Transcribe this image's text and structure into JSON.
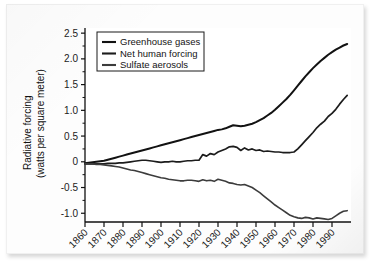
{
  "figure": {
    "kind": "scanned-line-chart",
    "background_color": "#fdfdfd"
  },
  "chart_data": {
    "type": "line",
    "title": "",
    "xlabel": "",
    "ylabel": "Radiative forcing (watts per square meter)",
    "ylabel_line1": "Radiative forcing",
    "ylabel_line2": "(watts per square meter)",
    "xlim": [
      1860,
      2000
    ],
    "ylim": [
      -1.17,
      2.6
    ],
    "grid": false,
    "legend_position": "upper-left",
    "y_ticks": [
      2.5,
      2.0,
      1.5,
      1.0,
      0.5,
      0,
      -0.5,
      -1.0
    ],
    "y_tick_labels": [
      "2.5",
      "2.0",
      "1.5",
      "1.0",
      "0.5",
      "0",
      "-0.5",
      "-1.0"
    ],
    "y_minor_tick_step": 0.25,
    "x_ticks": [
      1860,
      1870,
      1880,
      1890,
      1900,
      1910,
      1920,
      1930,
      1940,
      1950,
      1960,
      1970,
      1980,
      1990
    ],
    "x_tick_labels": [
      "1860",
      "1870",
      "1880",
      "1890",
      "1900",
      "1910",
      "1920",
      "1930",
      "1940",
      "1950",
      "1960",
      "1970",
      "1980",
      "1990"
    ],
    "x_tick_label_rotation": -45,
    "x": [
      1860,
      1862,
      1864,
      1866,
      1868,
      1870,
      1872,
      1874,
      1876,
      1878,
      1880,
      1882,
      1884,
      1886,
      1888,
      1890,
      1892,
      1894,
      1896,
      1898,
      1900,
      1902,
      1904,
      1906,
      1908,
      1910,
      1912,
      1914,
      1916,
      1918,
      1920,
      1922,
      1924,
      1926,
      1928,
      1930,
      1932,
      1934,
      1936,
      1938,
      1940,
      1942,
      1944,
      1946,
      1948,
      1950,
      1952,
      1954,
      1956,
      1958,
      1960,
      1962,
      1964,
      1966,
      1968,
      1970,
      1972,
      1974,
      1976,
      1978,
      1980,
      1982,
      1984,
      1986,
      1988,
      1990,
      1992,
      1994,
      1996,
      1998
    ],
    "series": [
      {
        "name": "Greenhouse gases",
        "color": "#121212",
        "width": 2.0,
        "values": [
          -0.03,
          -0.02,
          -0.01,
          0.0,
          0.01,
          0.02,
          0.04,
          0.06,
          0.08,
          0.1,
          0.12,
          0.14,
          0.16,
          0.18,
          0.2,
          0.22,
          0.24,
          0.26,
          0.28,
          0.3,
          0.32,
          0.34,
          0.36,
          0.38,
          0.4,
          0.42,
          0.44,
          0.46,
          0.48,
          0.5,
          0.52,
          0.54,
          0.56,
          0.58,
          0.6,
          0.62,
          0.63,
          0.65,
          0.68,
          0.71,
          0.7,
          0.69,
          0.7,
          0.72,
          0.74,
          0.77,
          0.81,
          0.85,
          0.9,
          0.95,
          1.01,
          1.08,
          1.15,
          1.22,
          1.3,
          1.39,
          1.48,
          1.57,
          1.66,
          1.74,
          1.82,
          1.89,
          1.96,
          2.02,
          2.08,
          2.13,
          2.18,
          2.22,
          2.26,
          2.29
        ]
      },
      {
        "name": "Net human forcing",
        "color": "#1c1c1c",
        "width": 1.7,
        "values": [
          -0.04,
          -0.04,
          -0.04,
          -0.04,
          -0.04,
          -0.04,
          -0.03,
          -0.03,
          -0.03,
          -0.02,
          -0.02,
          -0.01,
          0.0,
          0.01,
          0.02,
          0.03,
          0.03,
          0.02,
          0.01,
          0.0,
          -0.01,
          0.0,
          0.0,
          0.01,
          0.0,
          0.0,
          0.01,
          0.02,
          0.02,
          0.03,
          0.03,
          0.14,
          0.11,
          0.16,
          0.14,
          0.19,
          0.22,
          0.25,
          0.29,
          0.3,
          0.28,
          0.22,
          0.27,
          0.23,
          0.25,
          0.22,
          0.23,
          0.2,
          0.21,
          0.2,
          0.19,
          0.19,
          0.18,
          0.18,
          0.18,
          0.19,
          0.25,
          0.33,
          0.41,
          0.49,
          0.57,
          0.66,
          0.73,
          0.79,
          0.88,
          0.94,
          1.02,
          1.12,
          1.21,
          1.29
        ]
      },
      {
        "name": "Sulfate aerosols",
        "color": "#3c3c3c",
        "width": 1.6,
        "values": [
          -0.04,
          -0.04,
          -0.04,
          -0.05,
          -0.05,
          -0.06,
          -0.07,
          -0.08,
          -0.09,
          -0.1,
          -0.12,
          -0.14,
          -0.16,
          -0.17,
          -0.19,
          -0.21,
          -0.23,
          -0.25,
          -0.27,
          -0.29,
          -0.31,
          -0.32,
          -0.34,
          -0.35,
          -0.36,
          -0.37,
          -0.37,
          -0.36,
          -0.36,
          -0.37,
          -0.38,
          -0.35,
          -0.37,
          -0.36,
          -0.38,
          -0.34,
          -0.36,
          -0.38,
          -0.41,
          -0.42,
          -0.44,
          -0.45,
          -0.44,
          -0.47,
          -0.5,
          -0.55,
          -0.6,
          -0.66,
          -0.72,
          -0.78,
          -0.84,
          -0.89,
          -0.94,
          -0.99,
          -1.04,
          -1.07,
          -1.09,
          -1.1,
          -1.08,
          -1.09,
          -1.11,
          -1.09,
          -1.1,
          -1.11,
          -1.12,
          -1.1,
          -1.05,
          -1.0,
          -0.96,
          -0.95
        ]
      }
    ]
  },
  "legend": {
    "items": [
      {
        "label": "Greenhouse gases",
        "color": "#121212"
      },
      {
        "label": "Net human forcing",
        "color": "#1c1c1c"
      },
      {
        "label": "Sulfate aerosols",
        "color": "#3c3c3c"
      }
    ]
  }
}
